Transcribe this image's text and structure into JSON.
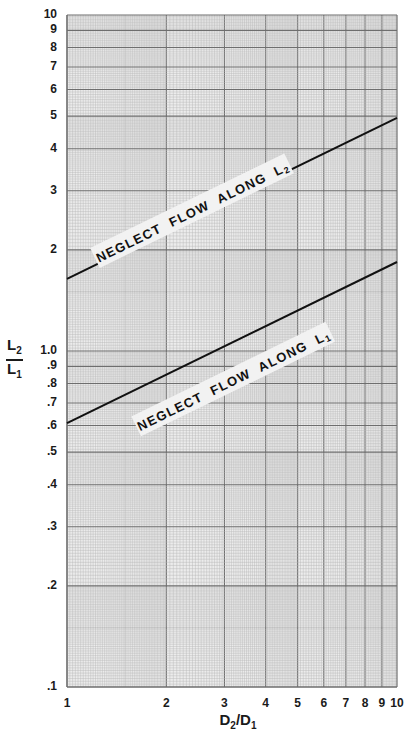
{
  "chart_data": {
    "type": "line",
    "title": "",
    "xscale": "log",
    "yscale": "log",
    "xlabel": "D2/D1",
    "ylabel": "L2/L1",
    "xlim": [
      1,
      10
    ],
    "ylim": [
      0.1,
      10
    ],
    "grid": true,
    "x_ticks": [
      "1",
      "2",
      "3",
      "4",
      "5",
      "6",
      "7",
      "8",
      "9",
      "10"
    ],
    "y_ticks": [
      "10",
      "9",
      "8",
      "7",
      "6",
      "5",
      "4",
      "3",
      "2",
      "1.0",
      ".9",
      ".8",
      ".7",
      ".6",
      ".5",
      ".4",
      ".3",
      ".2",
      ".1"
    ],
    "series": [
      {
        "name": "NEGLECT FLOW ALONG L2",
        "x": [
          1,
          10
        ],
        "y": [
          1.64,
          4.94
        ]
      },
      {
        "name": "NEGLECT FLOW ALONG L1",
        "x": [
          1,
          10
        ],
        "y": [
          0.61,
          1.84
        ]
      }
    ],
    "annotations": [
      {
        "text": "NEGLECT FLOW ALONG L",
        "subscript": "2",
        "x": 2.4,
        "y": 2.6
      },
      {
        "text": "NEGLECT FLOW ALONG L",
        "subscript": "1",
        "x": 3.2,
        "y": 0.82
      }
    ]
  },
  "axes": {
    "ylabel_num": "L",
    "ylabel_num_sub": "2",
    "ylabel_den": "L",
    "ylabel_den_sub": "1",
    "xlabel_a": "D",
    "xlabel_a_sub": "2",
    "xlabel_sep": "/",
    "xlabel_b": "D",
    "xlabel_b_sub": "1"
  },
  "colors": {
    "grid_minor": "#b8b8b8",
    "grid_major": "#6e6e6e",
    "line": "#111111",
    "label_bg": "#f2f2f2",
    "paper": "#ececec"
  }
}
